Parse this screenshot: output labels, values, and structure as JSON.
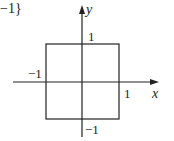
{
  "diagram": {
    "fragment_text": "−1}",
    "axes": {
      "x_label": "x",
      "y_label": "y"
    },
    "ticks": {
      "x_pos": "1",
      "x_neg": "−1",
      "y_pos": "1",
      "y_neg": "−1"
    },
    "shape": "square",
    "square_vertices": [
      [
        -1,
        1
      ],
      [
        1,
        1
      ],
      [
        1,
        -1
      ],
      [
        -1,
        -1
      ]
    ],
    "colors": {
      "stroke": "#222222",
      "background": "#ffffff"
    }
  }
}
